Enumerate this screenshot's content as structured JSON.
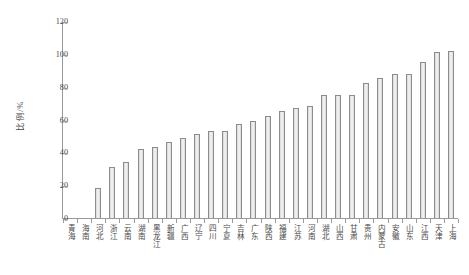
{
  "chart_data": {
    "type": "bar",
    "title": "",
    "subtitle": "",
    "xlabel": "",
    "ylabel": "比例/%",
    "ylim": [
      0,
      120
    ],
    "yticks": [
      0,
      20,
      40,
      60,
      80,
      100,
      120
    ],
    "grid": false,
    "legend": null,
    "bar_fill_color": "#ededed",
    "bar_edge_color": "#8c8c8c",
    "axis_color": "#9a9a9a",
    "categories": [
      "青海",
      "海南",
      "河北",
      "浙江",
      "云南",
      "湖南",
      "黑龙江",
      "新疆",
      "广西",
      "辽宁",
      "四川",
      "宁夏",
      "吉林",
      "广东",
      "陕西",
      "福建",
      "江苏",
      "河南",
      "湖北",
      "山西",
      "甘肃",
      "贵州",
      "内蒙古",
      "安徽",
      "山东",
      "江西",
      "天津",
      "上海"
    ],
    "values": [
      0,
      0,
      18,
      31,
      34,
      42,
      43,
      46,
      49,
      51,
      53,
      53,
      57,
      59,
      62,
      65,
      67,
      68,
      75,
      75,
      75,
      82,
      85,
      88,
      88,
      95,
      101,
      102
    ]
  }
}
